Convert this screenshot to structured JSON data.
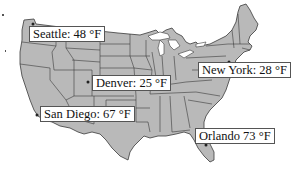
{
  "map": {
    "region": "Contiguous United States",
    "land_color": "#b9b9b9",
    "border_color": "#3a3a3a",
    "background_color": "#ffffff"
  },
  "cities": [
    {
      "name": "Seattle",
      "label": "Seattle: 48 °F",
      "temp_f": 48
    },
    {
      "name": "Denver",
      "label": "Denver: 25 °F",
      "temp_f": 25
    },
    {
      "name": "New York",
      "label": "New York: 28 °F",
      "temp_f": 28
    },
    {
      "name": "San Diego",
      "label": "San Diego: 67 °F",
      "temp_f": 67
    },
    {
      "name": "Orlando",
      "label": "Orlando 73 °F",
      "temp_f": 73
    }
  ]
}
